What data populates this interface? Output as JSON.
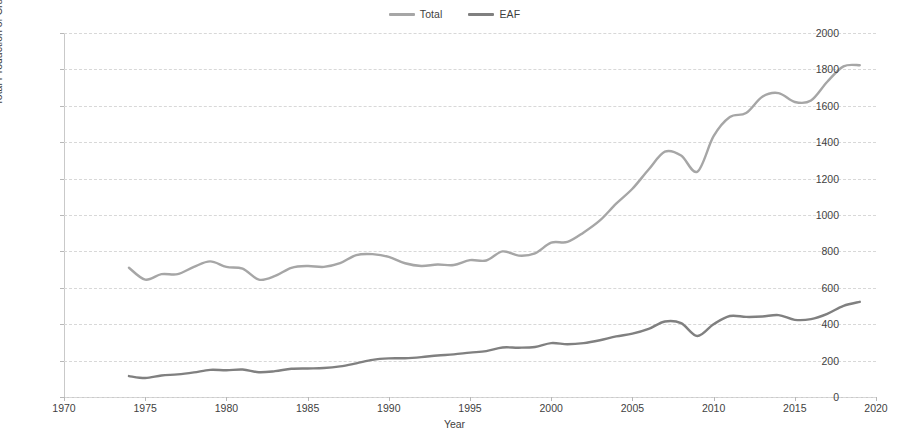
{
  "chart_data": {
    "type": "line",
    "title": "",
    "xlabel": "Year",
    "ylabel": "Total Production of Crude Steel, mln tons",
    "xlim": [
      1970,
      2020
    ],
    "ylim": [
      0,
      2000
    ],
    "ytick_step": 200,
    "xtick_step": 5,
    "grid": true,
    "legend_position": "top-center",
    "xticks": [
      1970,
      1975,
      1980,
      1985,
      1990,
      1995,
      2000,
      2005,
      2010,
      2015,
      2020
    ],
    "yticks": [
      0,
      200,
      400,
      600,
      800,
      1000,
      1200,
      1400,
      1600,
      1800,
      2000
    ],
    "x": [
      1974,
      1975,
      1976,
      1977,
      1978,
      1979,
      1980,
      1981,
      1982,
      1983,
      1984,
      1985,
      1986,
      1987,
      1988,
      1989,
      1990,
      1991,
      1992,
      1993,
      1994,
      1995,
      1996,
      1997,
      1998,
      1999,
      2000,
      2001,
      2002,
      2003,
      2004,
      2005,
      2006,
      2007,
      2008,
      2009,
      2010,
      2011,
      2012,
      2013,
      2014,
      2015,
      2016,
      2017,
      2018,
      2019
    ],
    "series": [
      {
        "name": "Total",
        "color": "#a6a6a6",
        "values": [
          710,
          645,
          675,
          675,
          715,
          745,
          715,
          705,
          645,
          665,
          710,
          720,
          715,
          735,
          780,
          785,
          770,
          735,
          720,
          728,
          725,
          752,
          750,
          800,
          777,
          789,
          848,
          852,
          904,
          970,
          1062,
          1144,
          1250,
          1348,
          1327,
          1238,
          1433,
          1538,
          1560,
          1650,
          1670,
          1621,
          1629,
          1732,
          1817,
          1823
        ]
      },
      {
        "name": "EAF",
        "color": "#808080",
        "values": [
          115,
          104,
          118,
          124,
          135,
          149,
          147,
          151,
          136,
          142,
          155,
          157,
          159,
          168,
          185,
          204,
          212,
          213,
          219,
          228,
          234,
          244,
          252,
          272,
          271,
          275,
          296,
          290,
          296,
          312,
          333,
          348,
          374,
          415,
          406,
          335,
          400,
          445,
          440,
          442,
          450,
          424,
          428,
          457,
          501,
          523
        ]
      }
    ]
  },
  "legend": {
    "entries": [
      {
        "label": "Total",
        "marker": "line-marker"
      },
      {
        "label": "EAF",
        "marker": "line-marker"
      }
    ]
  },
  "axes": {
    "y_title": "Total Production of Crude Steel, mln tons",
    "x_title": "Year",
    "y_tick_labels": [
      "2000",
      "1800",
      "1600",
      "1400",
      "1200",
      "1000",
      "800",
      "600",
      "400",
      "200",
      "0"
    ],
    "x_tick_labels": [
      "1970",
      "1975",
      "1980",
      "1985",
      "1990",
      "1995",
      "2000",
      "2005",
      "2010",
      "2015",
      "2020"
    ]
  },
  "colors": {
    "total_series": "#a6a6a6",
    "eaf_series": "#808080",
    "grid": "#d8d8d8",
    "axis": "#c9c9c9",
    "text": "#3f3f3f",
    "background": "#ffffff"
  }
}
